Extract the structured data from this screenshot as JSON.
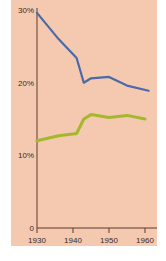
{
  "chart_data": {
    "type": "line",
    "title": "",
    "xlabel": "",
    "ylabel": "",
    "x_ticks": [
      "1930",
      "1940",
      "1950",
      "1960"
    ],
    "y_ticks": [
      "0",
      "10%",
      "20%",
      "30%"
    ],
    "xlim": [
      1930,
      1963
    ],
    "ylim": [
      0,
      30
    ],
    "grid": false,
    "legend": null,
    "series": [
      {
        "name": "blue line",
        "color": "#4a6aa8",
        "x": [
          1930,
          1932,
          1936,
          1941,
          1943,
          1945,
          1950,
          1955,
          1961
        ],
        "values": [
          29.6,
          28.4,
          26.0,
          23.4,
          20.0,
          20.6,
          20.8,
          19.6,
          18.9
        ]
      },
      {
        "name": "green line",
        "color": "#a4b82c",
        "x": [
          1930,
          1936,
          1941,
          1943,
          1945,
          1950,
          1955,
          1960
        ],
        "values": [
          12.0,
          12.7,
          13.0,
          15.0,
          15.6,
          15.2,
          15.5,
          15.0
        ]
      }
    ]
  },
  "colors": {
    "background": "#f5c9b0",
    "axis": "#5a3a2c"
  }
}
